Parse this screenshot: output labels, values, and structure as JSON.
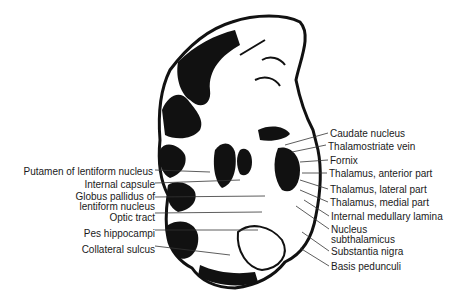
{
  "figure": {
    "labels_right": [
      {
        "text": "Caudate nucleus",
        "x": 330,
        "y": 128
      },
      {
        "text": "Thalamostriate vein",
        "x": 328,
        "y": 140
      },
      {
        "text": "Fornix",
        "x": 330,
        "y": 155
      },
      {
        "text": "Thalamus, anterior part",
        "x": 329,
        "y": 168
      },
      {
        "text": "Thalamus, lateral part",
        "x": 330,
        "y": 184
      },
      {
        "text": "Thalamus, medial part",
        "x": 330,
        "y": 197
      },
      {
        "text": "Internal medullary lamina",
        "x": 331,
        "y": 211
      },
      {
        "text": "Nucleus",
        "x": 331,
        "y": 224
      },
      {
        "text": "subthalamicus",
        "x": 331,
        "y": 234
      },
      {
        "text": "Substantia nigra",
        "x": 331,
        "y": 246
      },
      {
        "text": "Basis pedunculi",
        "x": 331,
        "y": 261
      }
    ],
    "labels_left": [
      {
        "text": "Putamen of lentiform nucleus",
        "right": 311,
        "y": 166
      },
      {
        "text": "Internal capsule",
        "right": 307,
        "y": 179
      },
      {
        "text": "Globus pallidus of",
        "right": 307,
        "y": 191
      },
      {
        "text": "lentiform nucleus",
        "right": 307,
        "y": 201
      },
      {
        "text": "Optic tract",
        "right": 307,
        "y": 212
      },
      {
        "text": "Pes hippocampi",
        "right": 307,
        "y": 228
      },
      {
        "text": "Collateral sulcus",
        "right": 307,
        "y": 244
      }
    ]
  }
}
